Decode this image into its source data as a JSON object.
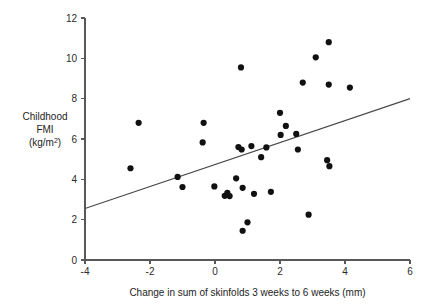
{
  "chart_data": {
    "type": "scatter",
    "title": "",
    "xlabel": "Change in sum of skinfolds 3 weeks to 6 weeks (mm)",
    "ylabel_lines": [
      "Childhood",
      "FMI",
      "(kg/m"
    ],
    "ylabel_sup": "2",
    "ylabel_tail": ")",
    "ylabel_plain": "Childhood FMI (kg/m2)",
    "xlim": [
      -4,
      6
    ],
    "ylim": [
      0,
      12
    ],
    "xticks": [
      -4,
      -2,
      0,
      2,
      4,
      6
    ],
    "xticklabels": [
      "-4",
      "-2",
      "0",
      "2",
      "4",
      "6"
    ],
    "yticks": [
      0,
      2,
      4,
      6,
      8,
      10,
      12
    ],
    "yticklabels": [
      "0",
      "2",
      "4",
      "6",
      "8",
      "10",
      "12"
    ],
    "grid": false,
    "legend": "none",
    "marker_color": "#111111",
    "axis_color": "#58585a",
    "line_color": "#4a4a4c",
    "marker_size": 3.1,
    "points": [
      {
        "x": -2.6,
        "y": 4.55
      },
      {
        "x": -2.35,
        "y": 6.8
      },
      {
        "x": -1.15,
        "y": 4.12
      },
      {
        "x": -1.0,
        "y": 3.62
      },
      {
        "x": -0.35,
        "y": 6.8
      },
      {
        "x": -0.38,
        "y": 5.83
      },
      {
        "x": -0.02,
        "y": 3.65
      },
      {
        "x": 0.3,
        "y": 3.18
      },
      {
        "x": 0.38,
        "y": 3.33
      },
      {
        "x": 0.45,
        "y": 3.17
      },
      {
        "x": 0.65,
        "y": 4.05
      },
      {
        "x": 0.72,
        "y": 5.6
      },
      {
        "x": 0.8,
        "y": 9.55
      },
      {
        "x": 0.82,
        "y": 5.48
      },
      {
        "x": 0.85,
        "y": 3.58
      },
      {
        "x": 0.85,
        "y": 1.45
      },
      {
        "x": 1.0,
        "y": 1.87
      },
      {
        "x": 1.12,
        "y": 5.65
      },
      {
        "x": 1.2,
        "y": 3.28
      },
      {
        "x": 1.42,
        "y": 5.1
      },
      {
        "x": 1.58,
        "y": 5.58
      },
      {
        "x": 1.72,
        "y": 3.38
      },
      {
        "x": 2.0,
        "y": 7.3
      },
      {
        "x": 2.02,
        "y": 6.2
      },
      {
        "x": 2.18,
        "y": 6.65
      },
      {
        "x": 2.5,
        "y": 6.25
      },
      {
        "x": 2.55,
        "y": 5.48
      },
      {
        "x": 2.7,
        "y": 8.8
      },
      {
        "x": 2.88,
        "y": 2.25
      },
      {
        "x": 3.1,
        "y": 10.05
      },
      {
        "x": 3.45,
        "y": 4.95
      },
      {
        "x": 3.5,
        "y": 10.8
      },
      {
        "x": 3.5,
        "y": 8.7
      },
      {
        "x": 3.52,
        "y": 4.65
      },
      {
        "x": 4.15,
        "y": 8.55
      }
    ],
    "fit_line": {
      "x1": -4,
      "y1": 2.55,
      "x2": 6,
      "y2": 8.0
    }
  }
}
